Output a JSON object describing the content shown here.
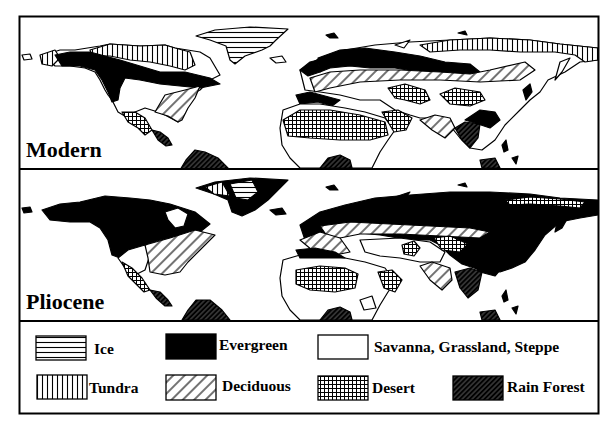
{
  "figure": {
    "type": "paleovegetation comparison map",
    "panels": [
      {
        "id": "modern",
        "label": "Modern"
      },
      {
        "id": "pliocene",
        "label": "Pliocene"
      }
    ],
    "legend": {
      "items": [
        {
          "key": "ice",
          "label": "Ice",
          "pattern": "horizontal-lines"
        },
        {
          "key": "evergreen",
          "label": "Evergreen",
          "pattern": "solid-black"
        },
        {
          "key": "savanna",
          "label": "Savanna, Grassland, Steppe",
          "pattern": "blank-white"
        },
        {
          "key": "tundra",
          "label": "Tundra",
          "pattern": "vertical-lines"
        },
        {
          "key": "deciduous",
          "label": "Deciduous",
          "pattern": "diagonal-lines"
        },
        {
          "key": "desert",
          "label": "Desert",
          "pattern": "crosshatch-grid"
        },
        {
          "key": "rainforest",
          "label": "Rain Forest",
          "pattern": "dense-dark-diagonal"
        }
      ]
    },
    "colors": {
      "ink": "#000000",
      "paper": "#ffffff"
    }
  }
}
